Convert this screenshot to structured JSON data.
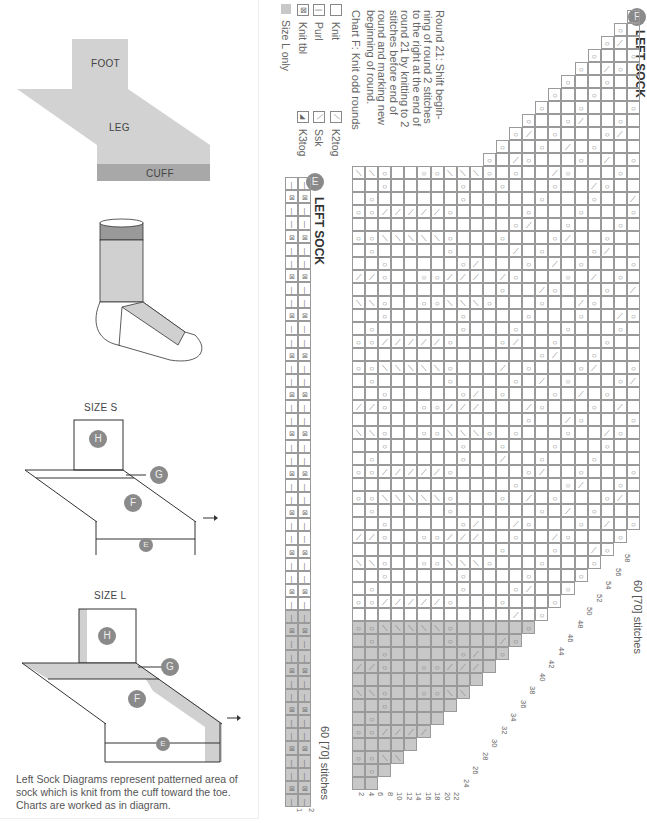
{
  "left_panel": {
    "schematic": {
      "foot": "FOOT",
      "leg": "LEG",
      "cuff": "CUFF"
    },
    "size_s": {
      "title": "SIZE S",
      "labels": [
        "H",
        "G",
        "F",
        "E"
      ]
    },
    "size_l": {
      "title": "SIZE L",
      "labels": [
        "H",
        "G",
        "F",
        "E"
      ]
    },
    "caption": "Left Sock Diagrams represent patterned area of sock which is knit from the cuff toward the toe. Charts are worked as in diagram."
  },
  "chart_f": {
    "badge": "F",
    "title": "LEFT SOCK",
    "note": "Round 21: Shift begin-\nning of round 2 stitches\nto the right at the end of\nround 21 by knitting to 2\nstitches before end of\nround and marking new\nbeginning of round.",
    "subnote": "Chart F: Knit odd rounds",
    "stitch_count": "60 [70] stitches",
    "row_numbers": [
      "2",
      "4",
      "6",
      "8",
      "10",
      "12",
      "14",
      "16",
      "18",
      "20",
      "22",
      "24",
      "26",
      "28",
      "30",
      "32",
      "34",
      "36",
      "38",
      "40",
      "42",
      "44",
      "46",
      "48",
      "50",
      "52",
      "54",
      "56",
      "58"
    ]
  },
  "chart_e": {
    "badge": "E",
    "title": "LEFT SOCK",
    "stitch_count": "60 [70] stitches",
    "row_numbers": [
      "1",
      "2"
    ]
  },
  "legend": {
    "items": [
      {
        "symbol": "",
        "label": "Knit"
      },
      {
        "symbol": "|",
        "label": "Purl"
      },
      {
        "symbol": "⊠",
        "label": "Knit tbl"
      },
      {
        "symbol": "",
        "label": "Size L only"
      },
      {
        "symbol": "⟋",
        "label": "K2tog"
      },
      {
        "symbol": "⟍",
        "label": "Ssk"
      },
      {
        "symbol": "◢",
        "label": "K3tog"
      }
    ]
  },
  "colors": {
    "shade": "#c8c8c8",
    "dark": "#9e9e9e",
    "badge": "#8a8a8a",
    "grid": "#9a9a9a"
  }
}
